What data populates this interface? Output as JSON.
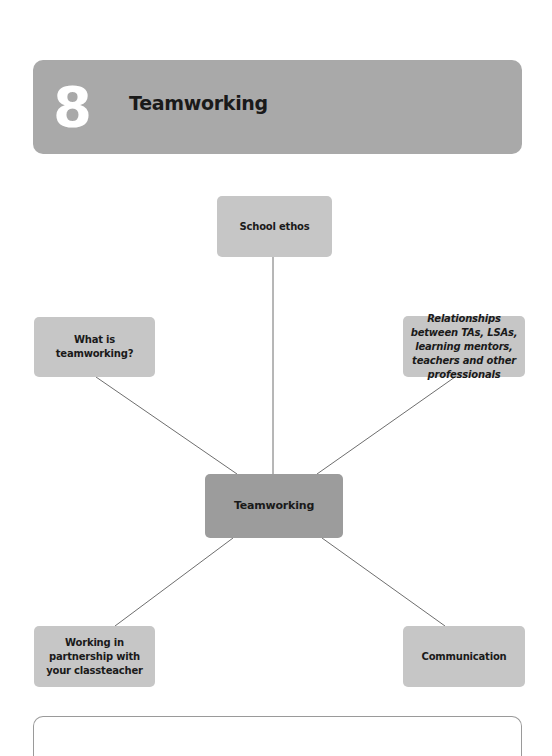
{
  "header": {
    "chapter_number": "8",
    "chapter_title": "Teamworking"
  },
  "diagram": {
    "center": {
      "label": "Teamworking"
    },
    "nodes": [
      {
        "id": "school-ethos",
        "label": "School ethos",
        "style": "normal"
      },
      {
        "id": "what-is-teamworking",
        "label": "What is teamworking?",
        "style": "normal"
      },
      {
        "id": "relationships",
        "label": "Relationships between TAs, LSAs, learning mentors, teachers and other professionals",
        "style": "italic"
      },
      {
        "id": "working-in-partnership",
        "label": "Working in partnership with your classteacher",
        "style": "normal"
      },
      {
        "id": "communication",
        "label": "Communication",
        "style": "normal"
      }
    ],
    "colors": {
      "header_bg": "#a9a9a9",
      "node_bg": "#c6c6c6",
      "center_bg": "#9c9c9c",
      "connector": "#6e6e6e",
      "text": "#1a1a1a"
    }
  }
}
